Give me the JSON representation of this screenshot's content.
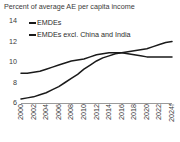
{
  "chart_data": {
    "type": "line",
    "title": "Percent of average AE per capita income",
    "xlabel": "",
    "ylabel": "",
    "ylim": [
      6,
      14
    ],
    "yticks": [
      6,
      8,
      10,
      12,
      14
    ],
    "grid": false,
    "legend_position": "top-left",
    "x": [
      "2000",
      "2001",
      "2002",
      "2003",
      "2004",
      "2005",
      "2006",
      "2007",
      "2008",
      "2009",
      "2010",
      "2011",
      "2012",
      "2013",
      "2014",
      "2015",
      "2016",
      "2017",
      "2018",
      "2019",
      "2020",
      "2021",
      "2022",
      "2023",
      "2024f"
    ],
    "xtick_labels": [
      "2000",
      "2002",
      "2004",
      "2006",
      "2008",
      "2010",
      "2012",
      "2014",
      "2016",
      "2018",
      "2020",
      "2022",
      "2024f"
    ],
    "series": [
      {
        "name": "EMDEs",
        "color": "#1a1a1a",
        "values": [
          6.4,
          6.5,
          6.6,
          6.8,
          7.0,
          7.3,
          7.6,
          8.0,
          8.4,
          8.8,
          9.3,
          9.7,
          10.1,
          10.4,
          10.6,
          10.8,
          10.9,
          11.0,
          11.1,
          11.2,
          11.3,
          11.5,
          11.7,
          11.9,
          12.0
        ]
      },
      {
        "name": "EMDEs excl. China and India",
        "color": "#1a1a1a",
        "values": [
          8.9,
          8.9,
          9.0,
          9.1,
          9.3,
          9.5,
          9.7,
          9.9,
          10.1,
          10.2,
          10.3,
          10.5,
          10.7,
          10.8,
          10.9,
          10.9,
          10.9,
          10.8,
          10.7,
          10.6,
          10.5,
          10.5,
          10.5,
          10.5,
          10.5
        ]
      }
    ]
  },
  "legend": {
    "items": [
      {
        "label": "EMDEs"
      },
      {
        "label": "EMDEs excl. China and India"
      }
    ]
  }
}
